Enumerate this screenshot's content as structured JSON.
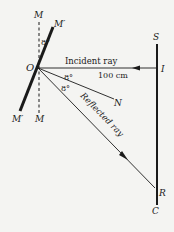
{
  "diagram": {
    "points": {
      "pivot": "O",
      "normal_top": "M",
      "normal_bottom": "M",
      "mirror_top": "M′",
      "mirror_bottom": "M′",
      "normal_end": "N",
      "scale_top": "S",
      "incident_point": "I",
      "reflected_point": "R",
      "scale_bottom": "C"
    },
    "labels": {
      "incident_ray": "Incident ray",
      "reflected_ray": "Reflected ray",
      "distance": "100 cm",
      "angle_mirror": "8°",
      "angle_incident": "8°",
      "angle_reflected": "8°"
    },
    "colors": {
      "ink": "#1a1a1a",
      "background": "#f4f4f2"
    }
  }
}
